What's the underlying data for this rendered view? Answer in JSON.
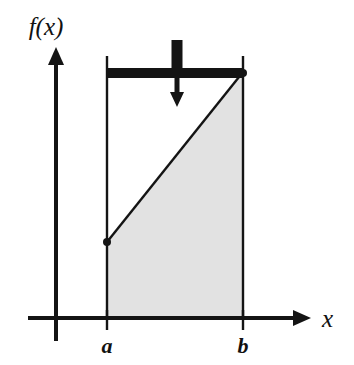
{
  "figure": {
    "background_color": "#ffffff",
    "ink_color": "#141414",
    "region_fill_color": "#e2e2e2",
    "axes": {
      "y_axis": {
        "label": "f(x)",
        "icon": "up-arrow-axis-icon",
        "x": 56,
        "top": 48,
        "bottom": 341,
        "label_x": 46,
        "label_y": 35
      },
      "x_axis": {
        "label": "x",
        "icon": "right-arrow-axis-icon",
        "y": 318,
        "left": 28,
        "right": 311,
        "label_x": 322,
        "label_y": 327
      }
    },
    "ticks": [
      {
        "label": "a",
        "x": 107,
        "label_x": 107,
        "label_y": 353
      },
      {
        "label": "b",
        "x": 243,
        "label_x": 243,
        "label_y": 353
      }
    ],
    "boundaries": [
      {
        "name": "left-boundary-line-a",
        "x": 107,
        "top": 56,
        "bottom": 318
      },
      {
        "name": "right-boundary-line-b",
        "x": 243,
        "top": 56,
        "bottom": 318
      }
    ],
    "function_curve": {
      "name": "linear-function-line",
      "x1": 107,
      "y1": 242,
      "x2": 243,
      "y2": 72,
      "endpoint_dot_x": 107,
      "endpoint_dot_y": 242,
      "endpoint_dot_r": 4
    },
    "shaded_region": {
      "name": "area-under-curve-region",
      "points": "107,242 243,72 243,318 107,318",
      "fill": "#e2e2e2"
    },
    "load_bar": {
      "name": "rigid-load-bar",
      "x": 107,
      "y": 68,
      "width": 136,
      "height": 10
    },
    "force_arrow": {
      "name": "downward-force-arrow",
      "x": 177,
      "stub_top": 40,
      "stub_width": 11,
      "stub_bottom": 78,
      "shaft_bottom": 92,
      "head_tip_y": 107,
      "head_half_width": 7
    }
  },
  "chart_data": {
    "type": "line",
    "title": "",
    "xlabel": "x",
    "ylabel": "f(x)",
    "x": [
      "a",
      "b"
    ],
    "values": [
      0.29,
      1.0
    ],
    "xlim": [
      "a",
      "b"
    ],
    "annotations": [
      "shaded area under f(x) between a and b",
      "uniform load bar spanning a to b",
      "downward resultant force arrow at midpoint"
    ],
    "grid": false,
    "legend": "none"
  }
}
